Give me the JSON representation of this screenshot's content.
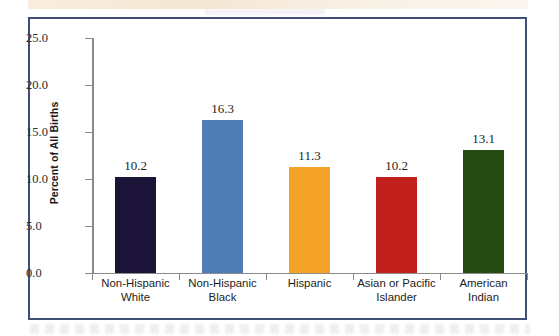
{
  "chart_data": {
    "type": "bar",
    "title": "",
    "subtitle": "",
    "xlabel": "",
    "ylabel": "Percent of All Births",
    "ylim": [
      0.0,
      25.0
    ],
    "ytick_labels": [
      "0.0",
      "5.0",
      "10.0",
      "15.0",
      "20.0",
      "25.0"
    ],
    "ytick_values": [
      0.0,
      5.0,
      10.0,
      15.0,
      20.0,
      25.0
    ],
    "grid": false,
    "legend": "none",
    "categories": [
      "Non-Hispanic White",
      "Non-Hispanic Black",
      "Hispanic",
      "Asian or Pacific Islander",
      "American Indian"
    ],
    "category_lines": [
      [
        "Non-Hispanic",
        "White"
      ],
      [
        "Non-Hispanic",
        "Black"
      ],
      [
        "Hispanic"
      ],
      [
        "Asian or Pacific",
        "Islander"
      ],
      [
        "American",
        "Indian"
      ]
    ],
    "values": [
      10.2,
      16.3,
      11.3,
      10.2,
      13.1
    ],
    "value_labels": [
      "10.2",
      "16.3",
      "11.3",
      "10.2",
      "13.1"
    ],
    "bar_colors": [
      "#1b1438",
      "#4f7cb5",
      "#f5a328",
      "#c2201c",
      "#254a12"
    ]
  },
  "style": {
    "frame_border_color": "#3f4f75",
    "axis_color": "#8b8b8b",
    "text_color": "#1c1c1c",
    "background": "#ffffff"
  }
}
